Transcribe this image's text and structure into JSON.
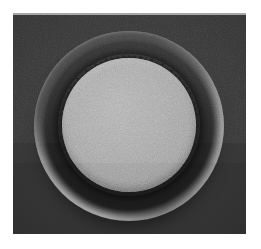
{
  "figure": {
    "title": "Circular textured specimen with surrounding rim",
    "caption": "",
    "modality": "grayscale-photograph",
    "width": 261,
    "height": 249
  },
  "canvas": {
    "margin_color": "#ffffff",
    "margin_left": 13,
    "margin_top": 13,
    "plate_width": 233,
    "plate_height": 221
  },
  "background": {
    "label": "dark-field-background",
    "color": "#343434",
    "color_edge": "#242424",
    "texture": "fine-grain-noise"
  },
  "rim": {
    "label": "outer-torus-rim",
    "color": "#9b9b9b",
    "shadow_color": "#1f1f1f",
    "center_x": 116,
    "center_y": 112,
    "outer_radius": 95,
    "inner_radius": 70,
    "highlight_positions": [
      "lower-left",
      "right"
    ],
    "shadow_positions": [
      "upper-left"
    ]
  },
  "disc": {
    "label": "inner-textured-disc",
    "color": "#a8a8a8",
    "color_light": "#b4b4b4",
    "color_dark": "#8a8a8a",
    "center_x": 116,
    "center_y": 112,
    "radius": 67,
    "texture": "fine-granular-speckle",
    "edge": "serrated"
  },
  "annotations": {
    "labels": [],
    "scale_bar": null,
    "arrows": []
  }
}
